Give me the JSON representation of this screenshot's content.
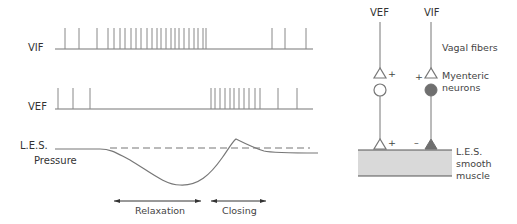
{
  "left_panel": {
    "vif_label": "VIF",
    "vef_label": "VEF",
    "les_label": "L.E.S.",
    "pressure_label": "Pressure",
    "relaxation_label": "Relaxation",
    "closing_label": "Closing",
    "vif_spikes_x": [
      65,
      79,
      97,
      108,
      114,
      120,
      125,
      131,
      136,
      141,
      147,
      152,
      157,
      161,
      166,
      171,
      175,
      179,
      184,
      189,
      194,
      198,
      203,
      206,
      272,
      285,
      306
    ],
    "vef_spikes_x": [
      58,
      73,
      90,
      211,
      215,
      220,
      225,
      230,
      234,
      239,
      244,
      249,
      255,
      260,
      278,
      297
    ]
  },
  "right_panel": {
    "vef_label": "VEF",
    "vif_label": "VIF",
    "vagal_fibers_label": "Vagal fibers",
    "myenteric_label_1": "Myenteric",
    "myenteric_label_2": "neurons",
    "les_label_1": "L.E.S.",
    "les_label_2": "smooth",
    "les_label_3": "muscle",
    "plus": "+",
    "minus": "–"
  },
  "colors": {
    "trace": "#777777",
    "muscle_fill": "#d9d9d9",
    "inhibitory_fill": "#6f6f6f"
  }
}
